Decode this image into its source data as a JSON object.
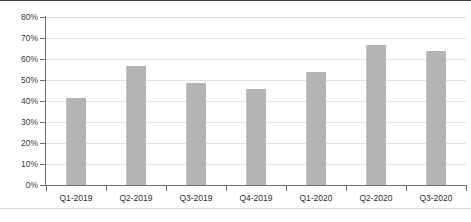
{
  "chart_data": {
    "type": "bar",
    "title": "",
    "subtitle": "",
    "xlabel": "",
    "ylabel": "",
    "categories": [
      "Q1-2019",
      "Q2-2019",
      "Q3-2019",
      "Q4-2019",
      "Q1-2020",
      "Q2-2020",
      "Q3-2020"
    ],
    "values": [
      41.5,
      56.5,
      48.5,
      45.5,
      54.0,
      66.5,
      64.0
    ],
    "value_labels": [
      "41.5%",
      "56.5%",
      "48.5%",
      "45.5%",
      "54.0%",
      "66.5%",
      "64.0%"
    ],
    "ylim": [
      0,
      80
    ],
    "ytick_values": [
      0,
      10,
      20,
      30,
      40,
      50,
      60,
      70,
      80
    ],
    "ytick_labels": [
      "0%",
      "10%",
      "20%",
      "30%",
      "40%",
      "50%",
      "60%",
      "70%",
      "80%"
    ],
    "grid": true,
    "grid_axis": "y",
    "legend": false,
    "legend_position": "none",
    "series": [
      {
        "name": "",
        "values": [
          41.5,
          56.5,
          48.5,
          45.5,
          54.0,
          66.5,
          64.0
        ]
      }
    ]
  },
  "style": {
    "bar_color": "#b4b4b4",
    "bar_edge_color": "#c4c4c4",
    "grid_color": "#e3e3e3",
    "axis_color": "#6e6e6e",
    "tick_label_color": "#3a3a3a",
    "category_label_color": "#2e2e2e",
    "background": "#ffffff",
    "frame_top_color": "#3c3c3c",
    "frame_bottom_color": "#d8d8d8"
  }
}
